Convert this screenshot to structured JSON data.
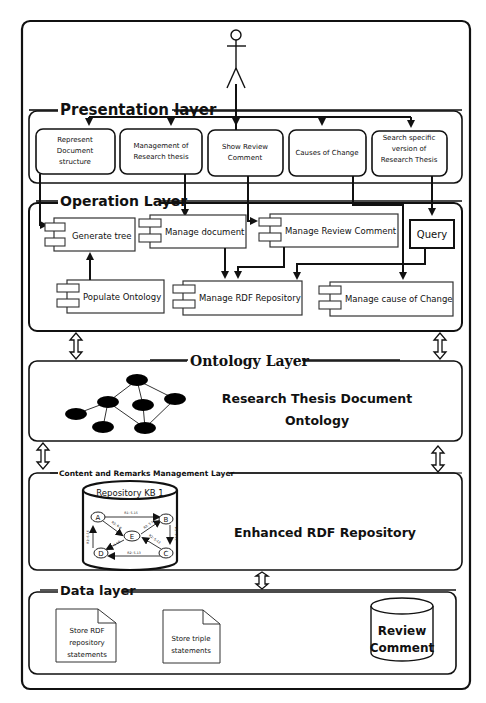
{
  "diagram": {
    "actor": {
      "name": "user-actor"
    },
    "presentation_layer": {
      "title": "Presentation layer",
      "boxes": [
        {
          "lines": [
            "Represent",
            "Document",
            "structure"
          ]
        },
        {
          "lines": [
            "Management of",
            "Research thesis"
          ]
        },
        {
          "lines": [
            "Show Review",
            "Comment"
          ]
        },
        {
          "lines": [
            "Causes of Change"
          ]
        },
        {
          "lines": [
            "Search specific",
            "version of",
            "Research Thesis"
          ]
        }
      ]
    },
    "operation_layer": {
      "title": "Operation Layer",
      "components": [
        {
          "label": "Generate tree"
        },
        {
          "label": "Manage document"
        },
        {
          "label": "Manage Review Comment"
        },
        {
          "label": "Query"
        },
        {
          "label": "Populate Ontology"
        },
        {
          "label": "Manage RDF Repository"
        },
        {
          "label": "Manage cause of Change"
        }
      ]
    },
    "ontology_layer": {
      "title": "Ontology Layer",
      "description_lines": [
        "Research Thesis Document",
        "Ontology"
      ]
    },
    "content_layer": {
      "title": "Content and Remarks Management Layer",
      "repository": {
        "title": "Repository KB 1",
        "nodes": [
          "A",
          "B",
          "C",
          "D",
          "E"
        ],
        "edges": [
          {
            "from": "A",
            "to": "B",
            "label": "R1: 5-15"
          },
          {
            "from": "A",
            "to": "E",
            "label": "R3: 6-8"
          },
          {
            "from": "E",
            "to": "B",
            "label": "R3: 5-10"
          },
          {
            "from": "B",
            "to": "C",
            "label": "R2: 9-11"
          },
          {
            "from": "C",
            "to": "E",
            "label": "R2: 5-12"
          },
          {
            "from": "E",
            "to": "D",
            "label": "R1: 5-10"
          },
          {
            "from": "C",
            "to": "D",
            "label": "R2: 5-13"
          },
          {
            "from": "D",
            "to": "A",
            "label": "R2: 6-16"
          }
        ]
      },
      "description": "Enhanced RDF Repository"
    },
    "data_layer": {
      "title": "Data layer",
      "documents": [
        {
          "lines": [
            "Store RDF",
            "repository",
            "statements"
          ]
        },
        {
          "lines": [
            "Store triple",
            "statements"
          ]
        }
      ],
      "database": {
        "lines": [
          "Review",
          "Comment"
        ]
      }
    }
  }
}
